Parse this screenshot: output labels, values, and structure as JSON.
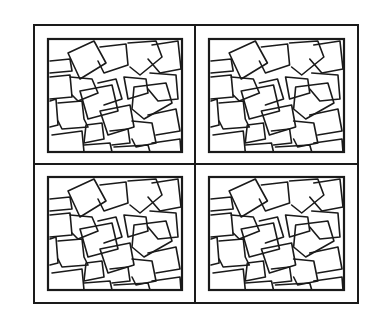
{
  "figure": {
    "stroke_color": "#1a1a1a",
    "background": "#ffffff",
    "outer_frame": {
      "x": 34,
      "y": 25,
      "w": 324,
      "h": 278,
      "stroke_width": 2
    },
    "dividers": {
      "vertical_x": 195,
      "horizontal_y": 164,
      "stroke_width": 2
    },
    "panels": [
      {
        "id": "top-left",
        "x": 48,
        "y": 39,
        "w": 134,
        "h": 113
      },
      {
        "id": "top-right",
        "x": 209,
        "y": 39,
        "w": 135,
        "h": 113
      },
      {
        "id": "bottom-left",
        "x": 48,
        "y": 177,
        "w": 134,
        "h": 113
      },
      {
        "id": "bottom-right",
        "x": 209,
        "y": 177,
        "w": 135,
        "h": 113
      }
    ],
    "panel_border_width": 2.2,
    "tile_stroke_width": 1.6,
    "tiles": [
      "M2,22 L22,20 L24,32 L2,34",
      "M20,14 L46,2 L58,24 L32,40 Z",
      "M52,8 L78,5 L80,26 L56,34 L50,22",
      "M80,4 L108,2 L114,18 L92,36 L82,28",
      "M104,6 L130,2 L133,30 L112,34 L100,20",
      "M2,38 L22,36 L24,58 L2,60",
      "M22,38 L44,40 L50,54 L30,62 L24,56",
      "M50,44 L68,40 L74,60 L56,66",
      "M76,38 L98,40 L100,54 L80,60 Z",
      "M102,34 L128,36 L130,60 L110,62 L100,50",
      "M32,52 L64,46 L70,72 L40,80 Z",
      "M86,48 L118,44 L124,64 L96,80 L84,70 Z",
      "M2,62 L8,60 L10,86 L2,88",
      "M10,64 L34,62 L36,80 L40,88 L14,90 L10,82",
      "M52,72 L82,66 L86,88 L60,96 Z",
      "M100,76 L128,70 L132,92 L108,96",
      "M38,86 L54,84 L56,100 L36,104 Z",
      "M62,92 L80,90 L82,104 L64,106",
      "M84,82 L104,84 L108,104 L88,108 L84,100",
      "M4,96 L34,92 L36,113 L6,113",
      "M36,106 L62,104 L64,113 L38,113",
      "M66,108 L100,106 L102,113 L68,113",
      "M104,104 L132,100 L133,113 L106,113"
    ]
  }
}
